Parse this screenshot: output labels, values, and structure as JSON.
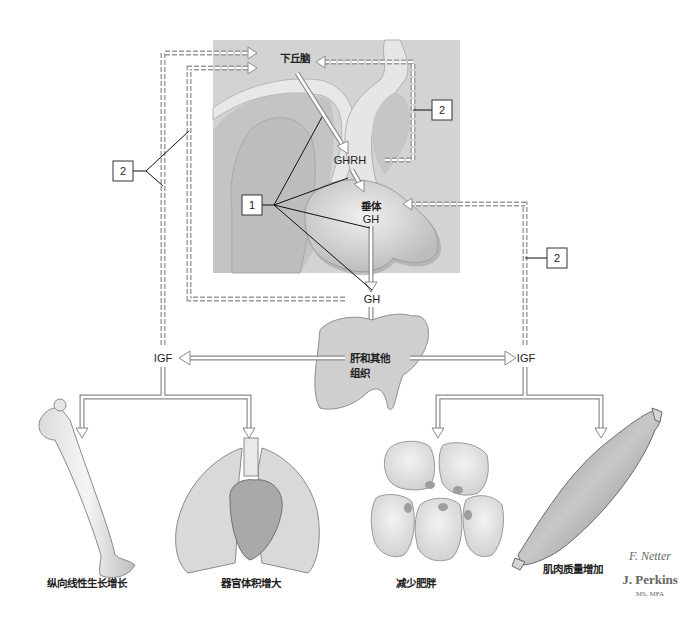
{
  "figure": {
    "labels": {
      "hypothalamus": "下丘脑",
      "ghrh": "GHRH",
      "pituitary": "垂体",
      "pituitary_gh": "GH",
      "gh": "GH",
      "liver": "肝和其他",
      "liver_line2": "组织",
      "igf_left": "IGF",
      "igf_right": "IGF"
    },
    "callouts": [
      {
        "id": "callout-1",
        "number": "1"
      },
      {
        "id": "callout-2-left",
        "number": "2"
      },
      {
        "id": "callout-2-upper-right",
        "number": "2"
      },
      {
        "id": "callout-2-right",
        "number": "2"
      }
    ],
    "effects": [
      {
        "organ": "bone",
        "label": "纵向线性生长增长"
      },
      {
        "organ": "lungs-heart",
        "label": "器官体积增大"
      },
      {
        "organ": "fat-cells",
        "label": "减少肥胖"
      },
      {
        "organ": "muscle",
        "label": "肌肉质量增加"
      }
    ],
    "signature": {
      "script": "F. Netter",
      "name": "J. Perkins",
      "credentials": "MS, MFA"
    },
    "colors": {
      "panel": "#d3d3d3",
      "tissue": "#c9c9c9",
      "membrane": "#e6e6e6",
      "chain": "#9a9a9a"
    }
  }
}
